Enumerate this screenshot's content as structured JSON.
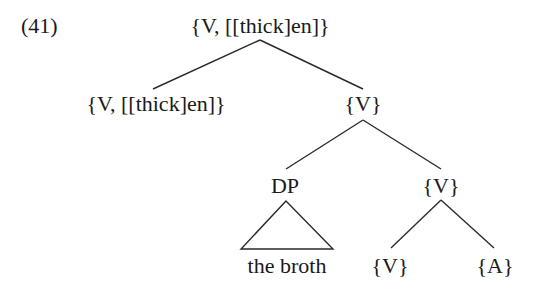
{
  "example_number": "(41)",
  "tree": {
    "root": {
      "label": "{V, [[thick]en]}"
    },
    "left_child": {
      "label": "{V, [[thick]en]}"
    },
    "right_child": {
      "label": "{V}"
    },
    "dp": {
      "label": "DP",
      "terminal": "the broth"
    },
    "inner_v": {
      "label": "{V}"
    },
    "leaf_v": {
      "label": "{V}"
    },
    "leaf_a": {
      "label": "{A}"
    }
  }
}
